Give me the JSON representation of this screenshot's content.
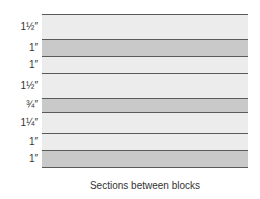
{
  "diagram": {
    "caption": "Sections between blocks",
    "colors": {
      "light": "#ececec",
      "dark": "#c9c9c9",
      "line": "#5a5a5a"
    },
    "sections": [
      {
        "label": "1½″",
        "tone": "light",
        "top": 14,
        "height": 25
      },
      {
        "label": "1″",
        "tone": "dark",
        "top": 39,
        "height": 17
      },
      {
        "label": "1″",
        "tone": "light",
        "top": 56,
        "height": 17
      },
      {
        "label": "1½″",
        "tone": "light",
        "top": 73,
        "height": 25
      },
      {
        "label": "¾″",
        "tone": "dark",
        "top": 98,
        "height": 14
      },
      {
        "label": "1¼″",
        "tone": "light",
        "top": 112,
        "height": 21
      },
      {
        "label": "1″",
        "tone": "light",
        "top": 133,
        "height": 17
      },
      {
        "label": "1″",
        "tone": "dark",
        "top": 150,
        "height": 17
      }
    ]
  }
}
